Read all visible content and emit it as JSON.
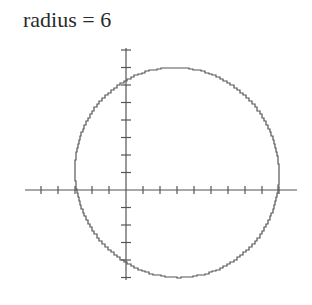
{
  "title": "radius = 6",
  "chart_data": {
    "type": "line",
    "title": "radius = 6",
    "shape": "circle",
    "center": [
      3,
      1
    ],
    "radius": 6,
    "xlabel": "",
    "ylabel": "",
    "xlim": [
      -6,
      10
    ],
    "ylim": [
      -5,
      8
    ],
    "x_ticks_unit": 1,
    "y_ticks_unit": 1,
    "tick_labels": false,
    "grid": false,
    "legend": false,
    "stroke_color": "#555555",
    "axis_color": "#555555"
  }
}
